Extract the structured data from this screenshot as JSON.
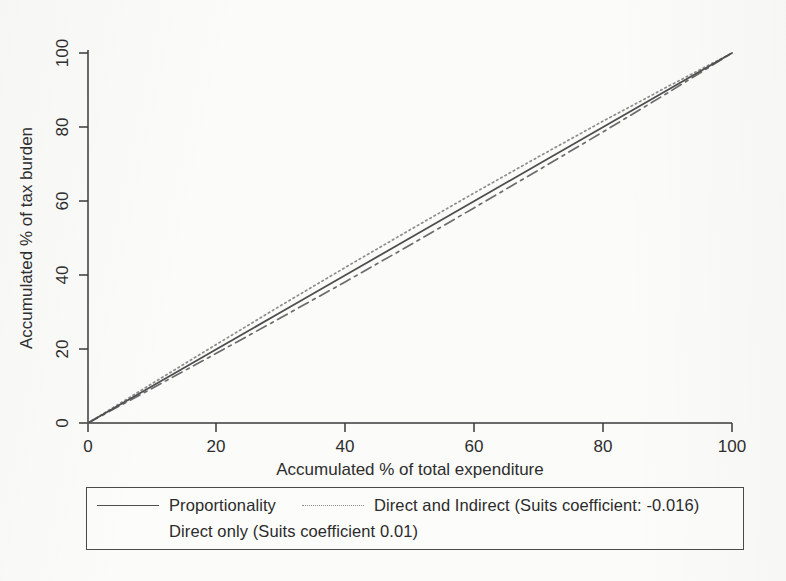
{
  "chart_data": {
    "type": "line",
    "title": "",
    "xlabel": "Accumulated % of total expenditure",
    "ylabel": "Accumulated % of tax burden",
    "xlim": [
      0,
      100
    ],
    "ylim": [
      0,
      100
    ],
    "xticks": [
      0,
      20,
      40,
      60,
      80,
      100
    ],
    "yticks": [
      0,
      20,
      40,
      60,
      80,
      100
    ],
    "grid": false,
    "legend_position": "below-axes",
    "x": [
      0,
      10,
      20,
      30,
      40,
      50,
      60,
      70,
      80,
      90,
      100
    ],
    "series": [
      {
        "name": "Proportionality",
        "style": "solid",
        "color": "#4e4e4e",
        "values": [
          0,
          10,
          20,
          30,
          40,
          50,
          60,
          70,
          80,
          90,
          100
        ]
      },
      {
        "name": "Direct and Indirect (Suits coefficient: -0.016)",
        "short_name": "Direct and Indirect",
        "suits_coefficient": -0.016,
        "style": "dotted",
        "color": "#8d8d8d",
        "values": [
          0,
          10.7,
          21.3,
          31.8,
          42.1,
          52.2,
          62.2,
          72.0,
          81.6,
          90.9,
          100
        ]
      },
      {
        "name": "Direct only (Suits coefficient 0.01)",
        "short_name": "Direct only",
        "suits_coefficient": 0.01,
        "style": "dashdot",
        "color": "#6b6b6b",
        "values": [
          0,
          9.4,
          18.9,
          28.5,
          38.2,
          48.1,
          58.2,
          68.4,
          78.7,
          89.2,
          100
        ]
      }
    ]
  },
  "axes": {
    "x_title": "Accumulated % of total expenditure",
    "y_title": "Accumulated % of tax burden",
    "x_tick_labels": [
      "0",
      "20",
      "40",
      "60",
      "80",
      "100"
    ],
    "y_tick_labels": [
      "0",
      "20",
      "40",
      "60",
      "80",
      "100"
    ]
  },
  "legend": {
    "entries": [
      {
        "label": "Proportionality",
        "style": "solid"
      },
      {
        "label": "Direct and Indirect (Suits coefficient: -0.016)",
        "style": "dotted"
      },
      {
        "label": "Direct only (Suits coefficient 0.01)",
        "style": "dashdot"
      }
    ]
  },
  "colors": {
    "background": "#fbfbf9",
    "axis": "#3a3a3a",
    "proportionality": "#4e4e4e",
    "direct_and_indirect": "#8d8d8d",
    "direct_only": "#6b6b6b",
    "legend_border": "#4a4a4a"
  }
}
